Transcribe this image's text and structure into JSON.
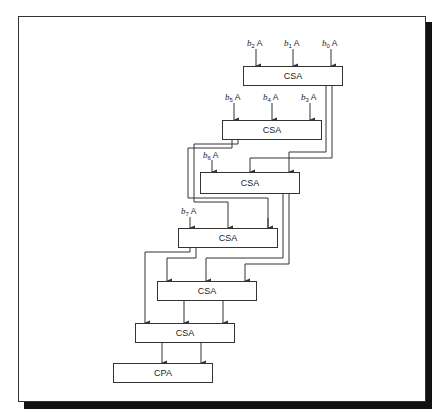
{
  "diagram": {
    "type": "carry-save multiplier array",
    "inputs": [
      {
        "id": "b2A",
        "var": "b",
        "sub": "2",
        "suffix": "A"
      },
      {
        "id": "b1A",
        "var": "b",
        "sub": "1",
        "suffix": "A"
      },
      {
        "id": "b0A",
        "var": "b",
        "sub": "0",
        "suffix": "A"
      },
      {
        "id": "b5A",
        "var": "b",
        "sub": "5",
        "suffix": "A"
      },
      {
        "id": "b4A",
        "var": "b",
        "sub": "4",
        "suffix": "A"
      },
      {
        "id": "b3A",
        "var": "b",
        "sub": "3",
        "suffix": "A"
      },
      {
        "id": "b6A",
        "var": "b",
        "sub": "6",
        "suffix": "A"
      },
      {
        "id": "b7A",
        "var": "b",
        "sub": "7",
        "suffix": "A"
      }
    ],
    "blocks": [
      {
        "id": "csa1",
        "label": "CSA"
      },
      {
        "id": "csa2",
        "label": "CSA"
      },
      {
        "id": "csa3",
        "label": "CSA"
      },
      {
        "id": "csa4",
        "label": "CSA"
      },
      {
        "id": "csa5",
        "label": "CSA"
      },
      {
        "id": "csa6",
        "label": "CSA"
      },
      {
        "id": "cpa",
        "label": "CPA"
      }
    ],
    "colors": {
      "line": "#333333",
      "shadow": "#111111",
      "background": "#ffffff"
    }
  }
}
